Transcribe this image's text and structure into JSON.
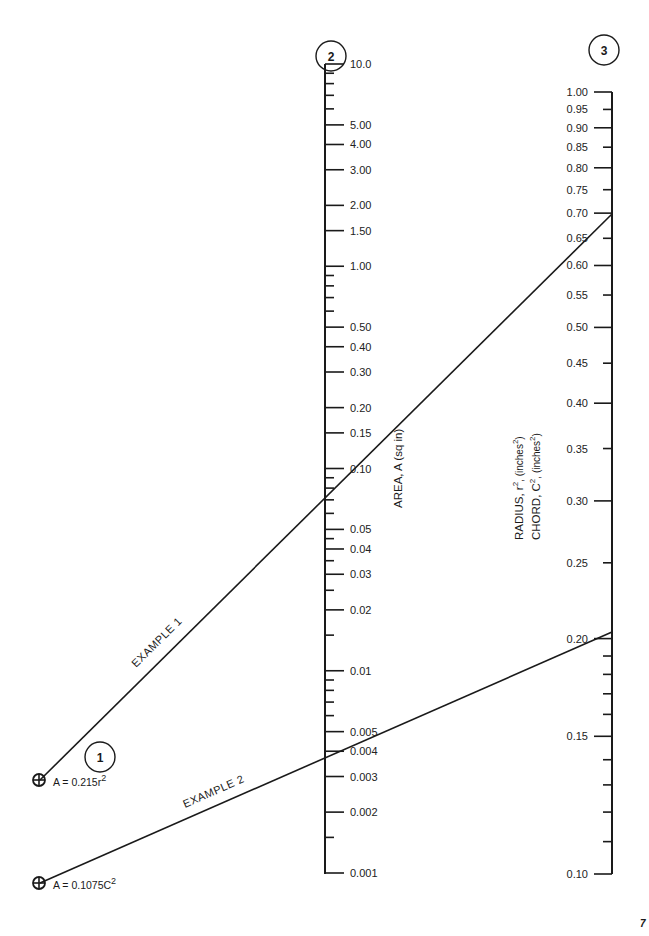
{
  "chart_data": {
    "type": "nomograph",
    "title": "",
    "scales": [
      {
        "id": 1,
        "label": "1",
        "kind": "pivot-points",
        "points": [
          {
            "name": "formula-radius",
            "formula": "A = 0.215r",
            "exponent": "2"
          },
          {
            "name": "formula-chord",
            "formula": "A = 0.1075C",
            "exponent": "2"
          }
        ]
      },
      {
        "id": 2,
        "label": "2",
        "title": "AREA, A (sq in)",
        "kind": "log",
        "range": [
          0.001,
          10.0
        ],
        "major_ticks": [
          {
            "v": 10.0,
            "t": "10.0"
          },
          {
            "v": 5.0,
            "t": "5.00"
          },
          {
            "v": 4.0,
            "t": "4.00"
          },
          {
            "v": 3.0,
            "t": "3.00"
          },
          {
            "v": 2.0,
            "t": "2.00"
          },
          {
            "v": 1.5,
            "t": "1.50"
          },
          {
            "v": 1.0,
            "t": "1.00"
          },
          {
            "v": 0.5,
            "t": "0.50"
          },
          {
            "v": 0.4,
            "t": "0.40"
          },
          {
            "v": 0.3,
            "t": "0.30"
          },
          {
            "v": 0.2,
            "t": "0.20"
          },
          {
            "v": 0.15,
            "t": "0.15"
          },
          {
            "v": 0.1,
            "t": "0.10"
          },
          {
            "v": 0.05,
            "t": "0.05"
          },
          {
            "v": 0.04,
            "t": "0.04"
          },
          {
            "v": 0.03,
            "t": "0.03"
          },
          {
            "v": 0.02,
            "t": "0.02"
          },
          {
            "v": 0.01,
            "t": "0.01"
          },
          {
            "v": 0.005,
            "t": "0.005"
          },
          {
            "v": 0.004,
            "t": "0.004"
          },
          {
            "v": 0.003,
            "t": "0.003"
          },
          {
            "v": 0.002,
            "t": "0.002"
          },
          {
            "v": 0.001,
            "t": "0.001"
          }
        ],
        "minor_ticks": [
          9,
          8,
          7,
          6,
          0.9,
          0.8,
          0.7,
          0.6,
          0.09,
          0.08,
          0.07,
          0.06,
          0.045,
          0.035,
          0.025,
          0.015,
          0.009,
          0.008,
          0.007,
          0.006,
          0.0015
        ]
      },
      {
        "id": 3,
        "label": "3",
        "title_lines": [
          {
            "text": "RADIUS, r",
            "sup": "2",
            "unit": ", (inches",
            "unit_sup": "2",
            "close": ")"
          },
          {
            "text": "CHORD, C",
            "sup": "2",
            "unit": ", (inches",
            "unit_sup": "2",
            "close": ")"
          }
        ],
        "kind": "log",
        "range": [
          0.1,
          1.0
        ],
        "major_ticks": [
          {
            "v": 1.0,
            "t": "1.00"
          },
          {
            "v": 0.9,
            "t": "0.90"
          },
          {
            "v": 0.8,
            "t": "0.80"
          },
          {
            "v": 0.7,
            "t": "0.70"
          },
          {
            "v": 0.6,
            "t": "0.60"
          },
          {
            "v": 0.5,
            "t": "0.50"
          },
          {
            "v": 0.4,
            "t": "0.40"
          },
          {
            "v": 0.3,
            "t": "0.30"
          },
          {
            "v": 0.2,
            "t": "0.20"
          },
          {
            "v": 0.15,
            "t": "0.15"
          },
          {
            "v": 0.1,
            "t": "0.10"
          }
        ],
        "mid_ticks": [
          {
            "v": 0.95,
            "t": "0.95"
          },
          {
            "v": 0.85,
            "t": "0.85"
          },
          {
            "v": 0.75,
            "t": "0.75"
          },
          {
            "v": 0.65,
            "t": "0.65"
          },
          {
            "v": 0.55,
            "t": "0.55"
          },
          {
            "v": 0.45,
            "t": "0.45"
          },
          {
            "v": 0.35,
            "t": "0.35"
          },
          {
            "v": 0.25,
            "t": "0.25"
          }
        ],
        "minor_ticks": [
          0.19,
          0.18,
          0.17,
          0.16,
          0.14,
          0.13,
          0.12,
          0.11
        ]
      }
    ],
    "examples": [
      {
        "label": "EXAMPLE 1",
        "from_scale1": "A = 0.215r²",
        "area": 0.1,
        "r_squared": 0.7
      },
      {
        "label": "EXAMPLE 2",
        "from_scale1": "A = 0.1075C²",
        "area": 0.005,
        "c_squared": 0.21
      }
    ]
  },
  "labels": {
    "circle1": "1",
    "circle2": "2",
    "circle3": "3",
    "example1": "EXAMPLE 1",
    "example2": "EXAMPLE 2",
    "area_title": "AREA, A (sq in)",
    "radius_title": "RADIUS, r",
    "radius_sup": "2",
    "radius_unit": ", (inches",
    "radius_unit_sup": "2",
    "chord_title": "CHORD, C",
    "chord_sup": "2",
    "chord_unit": ", (inches",
    "chord_unit_sup": "2",
    "close_paren": ")",
    "formula1": "A = 0.215r",
    "formula1_sup": "2",
    "formula2": "A = 0.1075C",
    "formula2_sup": "2",
    "page_number": "7"
  }
}
